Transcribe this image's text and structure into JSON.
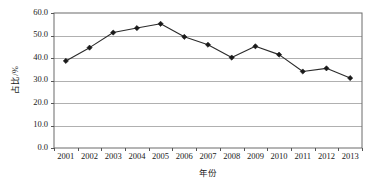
{
  "chart_data": {
    "type": "line",
    "title": "",
    "xlabel": "年份",
    "ylabel": "占比/%",
    "categories": [
      "2001",
      "2002",
      "2003",
      "2004",
      "2005",
      "2006",
      "2007",
      "2008",
      "2009",
      "2010",
      "2011",
      "2012",
      "2013"
    ],
    "values": [
      38.7,
      44.6,
      51.3,
      53.3,
      55.2,
      49.4,
      45.9,
      40.2,
      45.2,
      41.5,
      34.0,
      35.4,
      31.1
    ],
    "series": [
      {
        "name": "占比/%",
        "values": [
          38.7,
          44.6,
          51.3,
          53.3,
          55.2,
          49.4,
          45.9,
          40.2,
          45.2,
          41.5,
          34.0,
          35.4,
          31.1
        ]
      }
    ],
    "ylim": [
      0.0,
      60.0
    ],
    "ytick_labels": [
      "0.0",
      "10.0",
      "20.0",
      "30.0",
      "40.0",
      "50.0",
      "60.0"
    ],
    "ytick_values": [
      0.0,
      10.0,
      20.0,
      30.0,
      40.0,
      50.0,
      60.0
    ],
    "xtick_labels": [
      "2001",
      "2002",
      "2003",
      "2004",
      "2005",
      "2006",
      "2007",
      "2008",
      "2009",
      "2010",
      "2011",
      "2012",
      "2013"
    ],
    "grid": "horizontal",
    "legend": "none",
    "line_color": "#2b2b2b",
    "marker": "diamond",
    "marker_color": "#1a1a1a",
    "grid_color": "#b0b0b0",
    "axis_color": "#555555",
    "background": "#ffffff"
  }
}
